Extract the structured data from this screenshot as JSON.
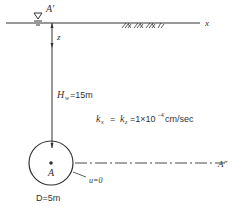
{
  "labels": {
    "top_point": "A′",
    "x_axis": "x",
    "z_axis": "z",
    "depth": "H",
    "depth_sub": "w",
    "depth_value": "=15m",
    "perm_kx": "k",
    "perm_kx_sub": "x",
    "perm_eq": "=",
    "perm_kz": "k",
    "perm_kz_sub": "z",
    "perm_value": "=1×10",
    "perm_exp": "−4",
    "perm_unit": "cm/sec",
    "center": "A",
    "pressure": "u=0",
    "diameter": "D=5m",
    "right_point": "A″"
  },
  "colors": {
    "line": "#333333",
    "text": "#333333"
  }
}
